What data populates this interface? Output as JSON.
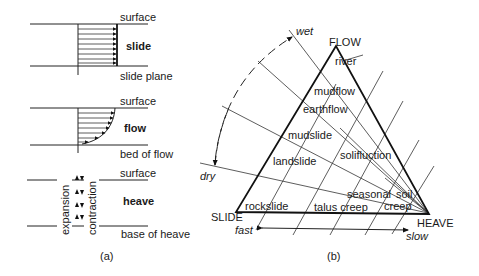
{
  "panel_a": {
    "caption": "(a)",
    "slide": {
      "top_label": "surface",
      "title": "slide",
      "bottom_label": "slide plane"
    },
    "flow": {
      "top_label": "surface",
      "title": "flow",
      "bottom_label": "bed of flow"
    },
    "heave": {
      "top_label": "surface",
      "title": "heave",
      "bottom_label": "base of heave",
      "left_vertical_label": "expansion",
      "right_vertical_label": "contraction"
    }
  },
  "panel_b": {
    "caption": "(b)",
    "vertices": {
      "top": "FLOW",
      "left": "SLIDE",
      "right": "HEAVE"
    },
    "moisture_axis": {
      "wet": "wet",
      "dry": "dry"
    },
    "speed_axis": {
      "fast": "fast",
      "slow": "slow"
    },
    "regions": [
      "river",
      "mudflow",
      "earthflow",
      "mudslide",
      "landslide",
      "solifluction",
      "seasonal soil creep",
      "rockslide",
      "talus creep"
    ],
    "region_labels": {
      "river": "river",
      "mudflow": "mudflow",
      "earthflow": "earthflow",
      "mudslide": "mudslide",
      "landslide": "landslide",
      "solifluction": "solifluction",
      "seasonal": "seasonal",
      "soil": "soil",
      "creep": "creep",
      "rockslide": "rockslide",
      "talus_creep": "talus creep"
    }
  }
}
